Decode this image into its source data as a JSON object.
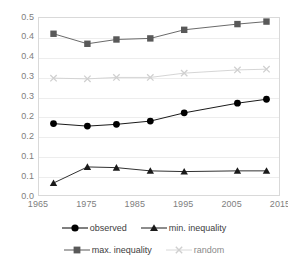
{
  "chart_data": {
    "type": "line",
    "title": "",
    "xlabel": "",
    "ylabel": "",
    "xlim": [
      1965,
      2015
    ],
    "ylim": [
      0.0,
      0.5
    ],
    "grid": true,
    "legend_position": "bottom",
    "x_ticks": [
      "1965",
      "1975",
      "1985",
      "1995",
      "2005",
      "2015"
    ],
    "x_tick_values": [
      1965,
      1975,
      1985,
      1995,
      2005,
      2015
    ],
    "y_ticks": [
      "0.5",
      "0.4",
      "0.4",
      "0.3",
      "0.3",
      "0.2",
      "0.2",
      "0.1",
      "0.1",
      "0.0"
    ],
    "y_tick_values": [
      0.5,
      0.45,
      0.4,
      0.35,
      0.3,
      0.25,
      0.2,
      0.15,
      0.1,
      0.0
    ],
    "x": [
      1968,
      1975,
      1981,
      1988,
      1995,
      2006,
      2012
    ],
    "series": [
      {
        "name": "observed",
        "marker": "circle",
        "color": "#000000",
        "values": [
          0.205,
          0.198,
          0.203,
          0.212,
          0.235,
          0.262,
          0.273
        ]
      },
      {
        "name": "min. inequality",
        "marker": "triangle",
        "color": "#1a1a1a",
        "values": [
          0.039,
          0.084,
          0.082,
          0.073,
          0.071,
          0.073,
          0.073
        ]
      },
      {
        "name": "max. inequality",
        "marker": "square",
        "color": "#595959",
        "values": [
          0.456,
          0.428,
          0.44,
          0.443,
          0.467,
          0.483,
          0.49
        ]
      },
      {
        "name": "random",
        "marker": "cross",
        "color": "#d0d0d0",
        "values": [
          0.332,
          0.33,
          0.334,
          0.334,
          0.346,
          0.355,
          0.357
        ]
      }
    ]
  },
  "legend": {
    "items": [
      {
        "label": "observed",
        "marker": "circle-marker",
        "color": "#000000"
      },
      {
        "label": "min. inequality",
        "marker": "triangle-marker",
        "color": "#1a1a1a"
      },
      {
        "label": "max. inequality",
        "marker": "square-marker",
        "color": "#595959"
      },
      {
        "label": "random",
        "marker": "cross-marker",
        "color": "#d0d0d0"
      }
    ]
  }
}
